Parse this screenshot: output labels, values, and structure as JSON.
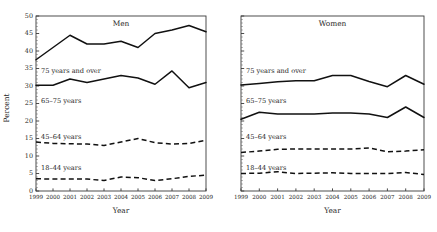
{
  "figure": {
    "ylabel": "Percent",
    "xlabel": "Year",
    "y_ticks": [
      "0",
      "5",
      "10",
      "15",
      "20",
      "25",
      "30",
      "35",
      "40",
      "45",
      "50"
    ],
    "x_ticks": [
      "1999",
      "2000",
      "2001",
      "2002",
      "2003",
      "2004",
      "2005",
      "2006",
      "2007",
      "2008",
      "2009"
    ],
    "panels": [
      {
        "title": "Men"
      },
      {
        "title": "Women"
      }
    ],
    "series_labels": {
      "a75": "75 years and over",
      "a65": "65–75 years",
      "a45": "45–64 years",
      "a18": "18–44 years"
    },
    "colors": {
      "line": "#111111",
      "axis": "#3a3a3a",
      "text": "#262626",
      "background": "#ffffff"
    }
  },
  "chart_data": [
    {
      "type": "line",
      "title": "Men",
      "xlabel": "Year",
      "ylabel": "Percent",
      "x": [
        1999,
        2000,
        2001,
        2002,
        2003,
        2004,
        2005,
        2006,
        2007,
        2008,
        2009
      ],
      "xlim": [
        1999,
        2009
      ],
      "ylim": [
        0,
        50
      ],
      "grid": false,
      "legend": "inline-labels",
      "series": [
        {
          "name": "75 years and over",
          "style": "solid",
          "values": [
            37.5,
            41.0,
            44.5,
            42.0,
            42.0,
            42.8,
            41.0,
            45.0,
            46.0,
            47.3,
            45.5
          ]
        },
        {
          "name": "65–75 years",
          "style": "solid",
          "values": [
            30.2,
            30.2,
            32.0,
            31.0,
            32.0,
            33.0,
            32.3,
            30.5,
            34.3,
            29.5,
            31.0
          ]
        },
        {
          "name": "45–64 years",
          "style": "dashed",
          "values": [
            14.0,
            13.6,
            13.5,
            13.4,
            13.0,
            14.0,
            15.0,
            13.8,
            13.4,
            13.6,
            14.5
          ]
        },
        {
          "name": "18–44 years",
          "style": "dashed",
          "values": [
            3.5,
            3.4,
            3.4,
            3.4,
            3.0,
            4.0,
            3.8,
            3.0,
            3.5,
            4.2,
            4.5
          ]
        }
      ]
    },
    {
      "type": "line",
      "title": "Women",
      "xlabel": "Year",
      "ylabel": "Percent",
      "x": [
        1999,
        2000,
        2001,
        2002,
        2003,
        2004,
        2005,
        2006,
        2007,
        2008,
        2009
      ],
      "xlim": [
        1999,
        2009
      ],
      "ylim": [
        0,
        50
      ],
      "grid": false,
      "legend": "inline-labels",
      "series": [
        {
          "name": "75 years and over",
          "style": "solid",
          "values": [
            30.3,
            30.7,
            31.2,
            31.5,
            31.5,
            33.0,
            33.0,
            31.3,
            29.8,
            33.0,
            30.5
          ]
        },
        {
          "name": "65–75 years",
          "style": "solid",
          "values": [
            20.5,
            22.5,
            22.0,
            22.0,
            22.0,
            22.3,
            22.3,
            22.0,
            21.0,
            24.0,
            21.0
          ]
        },
        {
          "name": "45–64 years",
          "style": "dashed",
          "values": [
            11.0,
            11.4,
            11.9,
            12.0,
            12.0,
            12.0,
            12.0,
            12.3,
            11.2,
            11.4,
            11.8
          ]
        },
        {
          "name": "18–44 years",
          "style": "dashed",
          "values": [
            5.0,
            5.1,
            5.5,
            5.0,
            5.1,
            5.2,
            5.0,
            5.0,
            5.0,
            5.3,
            4.7
          ]
        }
      ]
    }
  ]
}
